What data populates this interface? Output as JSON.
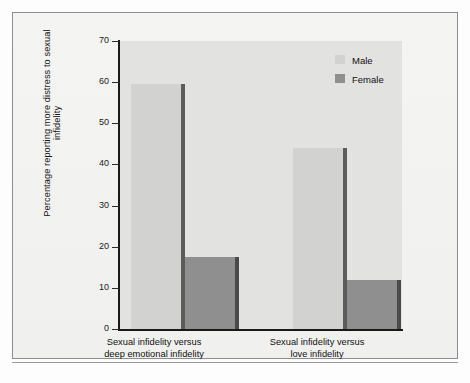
{
  "figure": {
    "frame_border_color": "#8d8d8d",
    "plot_background_color": "#e2e2e0",
    "page_background_color": "#f2f2f1"
  },
  "legend": {
    "position": "top-right",
    "entries": [
      {
        "label": "Male",
        "color": "#d2d2d0",
        "shadow": "#5c5c5c"
      },
      {
        "label": "Female",
        "color": "#8f8f8f",
        "shadow": "#4a4a4a"
      }
    ]
  },
  "axes": {
    "y_title": "Percentage reporting more distress to sexual infidelity",
    "y_ticks": [
      "0",
      "10",
      "20",
      "30",
      "40",
      "50",
      "60",
      "70"
    ],
    "y_min": 0,
    "y_max": 70
  },
  "categories": [
    {
      "line1": "Sexual infidelity versus",
      "line2": "deep emotional infidelity"
    },
    {
      "line1": "Sexual infidelity versus",
      "line2": "love infidelity"
    }
  ],
  "caption": {
    "text": ""
  },
  "chart_data": {
    "type": "bar",
    "title": "",
    "xlabel": "",
    "ylabel": "Percentage reporting more distress to sexual infidelity",
    "ylim": [
      0,
      70
    ],
    "yticks": [
      0,
      10,
      20,
      30,
      40,
      50,
      60,
      70
    ],
    "grid": false,
    "legend_position": "top-right",
    "categories": [
      "Sexual infidelity versus deep emotional infidelity",
      "Sexual infidelity versus love infidelity"
    ],
    "series": [
      {
        "name": "Male",
        "color": "#d2d2d0",
        "values": [
          59.5,
          44.0
        ]
      },
      {
        "name": "Female",
        "color": "#8f8f8f",
        "values": [
          17.5,
          12.0
        ]
      }
    ]
  }
}
